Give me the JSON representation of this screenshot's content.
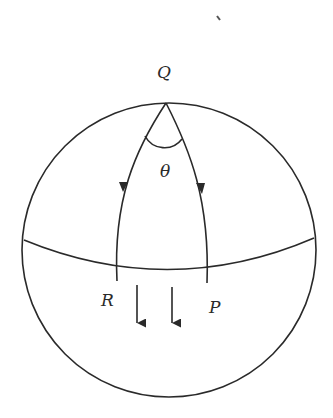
{
  "diagram": {
    "labels": {
      "top_point": "Q",
      "angle": "θ",
      "left_point": "R",
      "right_point": "P"
    },
    "colors": {
      "stroke": "#2a2a2a",
      "background": "#ffffff"
    }
  }
}
